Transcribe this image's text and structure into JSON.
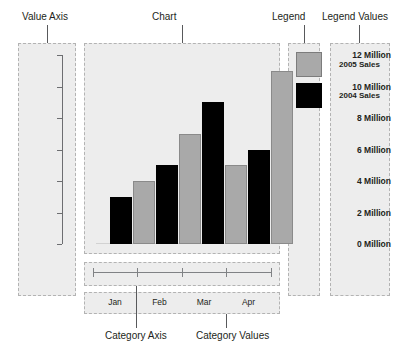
{
  "callouts": {
    "value_axis": "Value Axis",
    "chart": "Chart",
    "legend": "Legend",
    "legend_values": "Legend Values",
    "category_axis": "Category Axis",
    "category_values": "Category Values"
  },
  "chart_data": {
    "type": "bar",
    "title": "Chart",
    "xlabel": "Category Axis",
    "ylabel": "Value Axis",
    "categories": [
      "Jan",
      "Feb",
      "Mar",
      "Apr"
    ],
    "series": [
      {
        "name": "2004 Sales",
        "color": "#000000",
        "values": [
          3,
          5,
          9,
          6
        ]
      },
      {
        "name": "2005 Sales",
        "color": "#a9a9a9",
        "values": [
          4,
          7,
          5,
          11
        ]
      }
    ],
    "value_axis_ticks": [
      "0 Million",
      "2 Million",
      "4 Million",
      "6 Million",
      "8 Million",
      "10 Million",
      "12 Million"
    ],
    "value_axis_tick_numbers": [
      0,
      2,
      4,
      6,
      8,
      10,
      12
    ],
    "ylim": [
      0,
      12
    ],
    "unit": "Million",
    "grid": false,
    "legend_position": "right"
  },
  "colors": {
    "series_2005": "#a9a9a9",
    "series_2004": "#000000",
    "region_fill": "#ededed",
    "region_border": "#b3b3b3",
    "text": "#231f20"
  }
}
